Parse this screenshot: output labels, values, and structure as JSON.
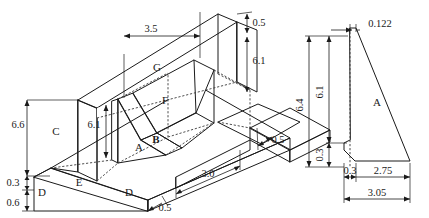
{
  "views": {
    "isometric": {
      "name": "isometric-view",
      "face_labels": [
        {
          "id": "A",
          "text": "A"
        },
        {
          "id": "B",
          "text": "B"
        },
        {
          "id": "C",
          "text": "C"
        },
        {
          "id": "D1",
          "text": "D"
        },
        {
          "id": "D2",
          "text": "D"
        },
        {
          "id": "E",
          "text": "E"
        },
        {
          "id": "F",
          "text": "F"
        },
        {
          "id": "G",
          "text": "G"
        }
      ],
      "dimensions": [
        {
          "id": "top-length",
          "value": "3.5"
        },
        {
          "id": "wall-height",
          "value": "6.6"
        },
        {
          "id": "heel-thickness",
          "value": "0.3"
        },
        {
          "id": "base-thickness",
          "value": "0.6"
        },
        {
          "id": "buttress-height",
          "value": "6.1"
        },
        {
          "id": "stem-top-thickness",
          "value": "0.5"
        },
        {
          "id": "stem-height-right",
          "value": "6.1"
        },
        {
          "id": "toe-width",
          "value": "0.5"
        },
        {
          "id": "base-front-width",
          "value": "0.5"
        },
        {
          "id": "base-length",
          "value": "3.0"
        }
      ]
    },
    "section": {
      "name": "cross-section-view",
      "face_labels": [
        {
          "id": "A",
          "text": "A"
        }
      ],
      "dimensions": [
        {
          "id": "stem-top-width",
          "value": "0.122"
        },
        {
          "id": "total-height",
          "value": "6.4"
        },
        {
          "id": "stem-height",
          "value": "6.1"
        },
        {
          "id": "base-thickness",
          "value": "0.3"
        },
        {
          "id": "heel-width",
          "value": "0.3"
        },
        {
          "id": "toe-width",
          "value": "2.75"
        },
        {
          "id": "total-width",
          "value": "3.05"
        }
      ]
    }
  },
  "colors": {
    "line": "#1a1a1a",
    "hidden_line": "#3a3a3a",
    "face_dark": "#a9a9a9",
    "face_light": "#e8e8e8",
    "face_mid": "#d0d0d0",
    "background": "#ffffff"
  }
}
